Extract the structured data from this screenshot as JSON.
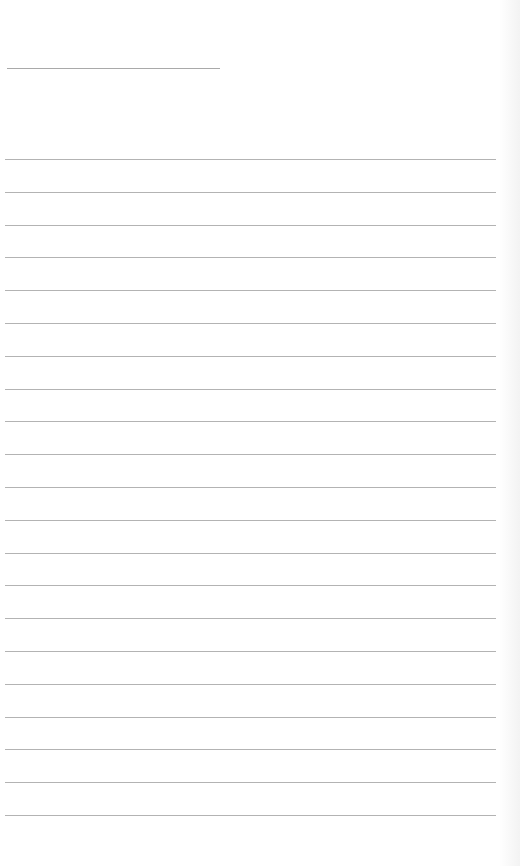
{
  "document": {
    "type": "lined-notepad-page",
    "title_line": {
      "x": 7,
      "y": 68,
      "width": 213,
      "color": "#a9a9a9"
    },
    "rules": {
      "count": 21,
      "first_y": 159,
      "spacing": 32.8,
      "x": 5,
      "width": 491,
      "color": "#b3b3b3"
    },
    "paper_color": "#ffffff"
  }
}
